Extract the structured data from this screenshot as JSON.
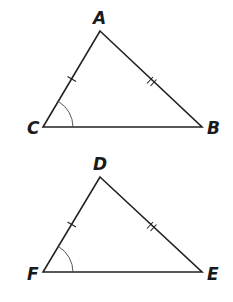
{
  "diagram": {
    "type": "congruent-triangles",
    "triangles": [
      {
        "name": "ABC",
        "vertices": {
          "A": {
            "label": "A",
            "x": 100,
            "y": 31
          },
          "B": {
            "label": "B",
            "x": 202,
            "y": 127
          },
          "C": {
            "label": "C",
            "x": 43,
            "y": 127
          }
        },
        "marks": {
          "CA": "single-tick",
          "AB": "double-tick",
          "angle_C": "arc"
        }
      },
      {
        "name": "DEF",
        "vertices": {
          "D": {
            "label": "D",
            "x": 100,
            "y": 177
          },
          "E": {
            "label": "E",
            "x": 202,
            "y": 272
          },
          "F": {
            "label": "F",
            "x": 43,
            "y": 272
          }
        },
        "marks": {
          "FD": "single-tick",
          "DE": "double-tick",
          "angle_F": "arc"
        }
      }
    ]
  }
}
